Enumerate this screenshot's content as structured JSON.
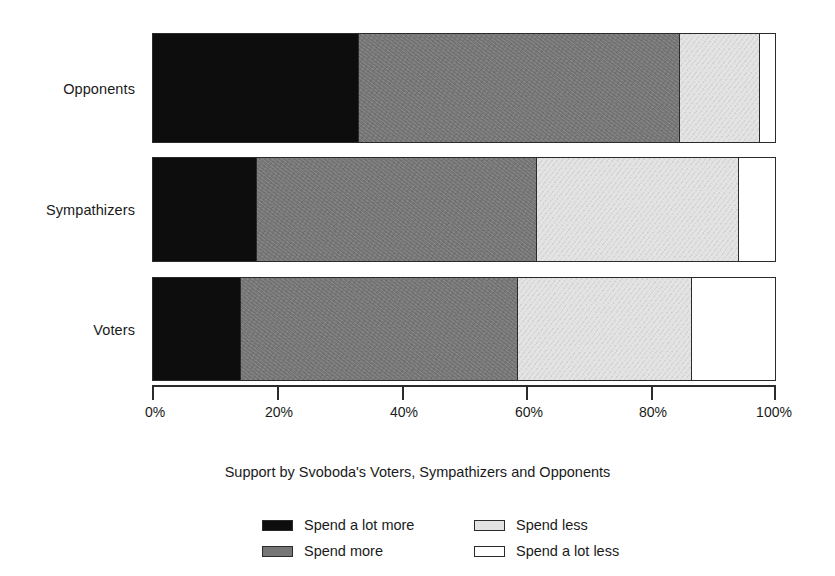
{
  "chart_data": {
    "type": "bar",
    "subtype": "stacked-horizontal-100pct",
    "title": "",
    "caption": "Support by Svoboda's Voters, Sympathizers and Opponents",
    "xlabel": "",
    "ylabel": "",
    "orientation": "horizontal",
    "stacked": true,
    "grid": false,
    "legend_position": "bottom",
    "xlim": [
      0,
      100
    ],
    "xticks": [
      0,
      20,
      40,
      60,
      80,
      100
    ],
    "xtick_labels": [
      "0%",
      "20%",
      "40%",
      "60%",
      "80%",
      "100%"
    ],
    "categories": [
      "Opponents",
      "Sympathizers",
      "Voters"
    ],
    "series": [
      {
        "name": "Spend a lot more",
        "color": "#0d0d0d",
        "values": [
          33.0,
          16.5,
          14.0
        ]
      },
      {
        "name": "Spend more",
        "color": "#767676",
        "values": [
          51.5,
          45.0,
          44.5
        ]
      },
      {
        "name": "Spend less",
        "color": "#e2e2e2",
        "values": [
          13.0,
          32.5,
          28.0
        ]
      },
      {
        "name": "Spend a lot less",
        "color": "#ffffff",
        "values": [
          2.5,
          6.0,
          13.5
        ]
      }
    ]
  },
  "axis": {
    "ticks": [
      {
        "label": "0%",
        "value": 0
      },
      {
        "label": "20%",
        "value": 20
      },
      {
        "label": "40%",
        "value": 40
      },
      {
        "label": "60%",
        "value": 60
      },
      {
        "label": "80%",
        "value": 80
      },
      {
        "label": "100%",
        "value": 100
      }
    ]
  },
  "categories": [
    {
      "label": "Opponents"
    },
    {
      "label": "Sympathizers"
    },
    {
      "label": "Voters"
    }
  ],
  "legend": {
    "items": [
      {
        "label": "Spend a lot more",
        "swatch": "s0"
      },
      {
        "label": "Spend less",
        "swatch": "s2"
      },
      {
        "label": "Spend more",
        "swatch": "s1"
      },
      {
        "label": "Spend a lot less",
        "swatch": "s3"
      }
    ]
  },
  "caption": {
    "text": "Support by Svoboda's Voters, Sympathizers and Opponents"
  },
  "colors": {
    "spend_a_lot_more": "#0d0d0d",
    "spend_more": "#767676",
    "spend_less": "#e2e2e2",
    "spend_a_lot_less": "#ffffff",
    "outline": "#2b2b2b",
    "background": "#ffffff"
  }
}
